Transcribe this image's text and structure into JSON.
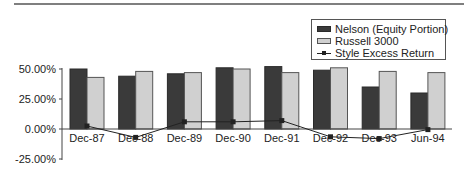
{
  "chart_data": {
    "type": "bar",
    "title": "",
    "xlabel": "",
    "ylabel": "",
    "categories": [
      "Dec-87",
      "Dec-88",
      "Dec-89",
      "Dec-90",
      "Dec-91",
      "Dec-92",
      "Dec-93",
      "Jun-94"
    ],
    "series": [
      {
        "name": "Nelson (Equity Portion)",
        "type": "bar",
        "color": "#3a3a3a",
        "values": [
          50,
          44,
          46,
          51,
          52,
          49,
          35,
          30
        ]
      },
      {
        "name": "Russell 3000",
        "type": "bar",
        "color": "#d0d0d0",
        "values": [
          43,
          48,
          47,
          50,
          47,
          51,
          48,
          47
        ]
      },
      {
        "name": "Style Excess Return",
        "type": "line",
        "color": "#222222",
        "marker": "square",
        "values": [
          2.5,
          -7,
          6,
          6,
          7,
          -6.5,
          -8,
          -0.5
        ]
      }
    ],
    "ylim": [
      -25,
      50
    ],
    "yticks": [
      50,
      25,
      0,
      -25
    ],
    "ytick_labels": [
      "50.00%",
      "25.00%",
      "0.00%",
      "-25.00%"
    ],
    "grid": false,
    "legend_position": "upper-right"
  },
  "legend": {
    "items": [
      {
        "label": "Nelson (Equity Portion)",
        "kind": "bar-dark"
      },
      {
        "label": "Russell 3000",
        "kind": "bar-light"
      },
      {
        "label": "Style Excess Return",
        "kind": "line-marker"
      }
    ]
  }
}
